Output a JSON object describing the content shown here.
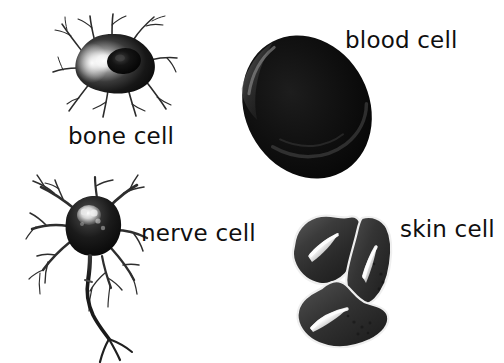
{
  "diagram": {
    "background_color": "#ffffff",
    "ink_color": "#100f0f",
    "style": "grayscale scientific illustration",
    "width": 504,
    "height": 363
  },
  "cells": [
    {
      "id": "bone-cell",
      "label": "bone cell",
      "scientific_name": "osteocyte",
      "description": "Dark blobby cell body with a bright crescent highlight on the left, a darker nucleus to the center-right, and many thin branching cytoplasmic processes radiating outward in all directions.",
      "position": "top-left",
      "label_x": 68,
      "label_y": 125,
      "body_fill": "#141414",
      "highlight_color": "#f2f2f2",
      "nucleus_color": "#0a0a0a"
    },
    {
      "id": "blood-cell",
      "label": "blood cell",
      "scientific_name": "erythrocyte",
      "description": "Large very dark biconcave disc drawn as a tilted ellipse, with a faint pale rim highlight along the upper-left edge and a subtle curved highlight across the lower half showing the central depression.",
      "position": "top-right",
      "label_x": 345,
      "label_y": 29,
      "body_fill": "#0c0c0c",
      "highlight_color": "#6b6b6b",
      "rotation_deg": -28
    },
    {
      "id": "nerve-cell",
      "label": "nerve cell",
      "scientific_name": "neuron",
      "description": "Rounded dark soma with bright highlight spots marking the nucleus and organelles, several branching dendrites spreading up and to the left and right, and a long wavy axon descending to terminal branches at the bottom.",
      "position": "bottom-left",
      "label_x": 141,
      "label_y": 222,
      "body_fill": "#1a1a1a",
      "highlight_color": "#f5f5f5",
      "process_color": "#2a2a2a"
    },
    {
      "id": "skin-cell",
      "label": "skin cell",
      "scientific_name": "epithelial cell",
      "description": "Cluster of three interlocking irregular polygonal cells with pale outlines between them; each cell carries a bright elongated diagonal highlight streak and small dark granular dots.",
      "position": "bottom-right",
      "label_x": 400,
      "label_y": 218,
      "body_fill": "#3a3a3a",
      "outline_color": "#f0f0f0",
      "highlight_color": "#ffffff",
      "count": 3
    }
  ]
}
